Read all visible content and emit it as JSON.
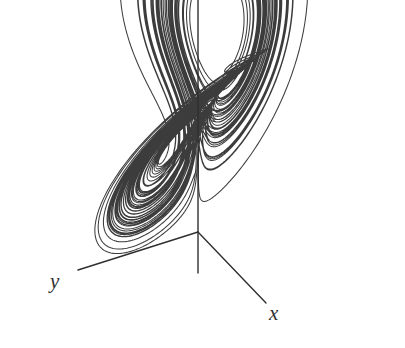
{
  "figure": {
    "kind": "phase-portrait",
    "name": "Lorenz attractor",
    "background_color": "#ffffff",
    "ink_color": "#3c3c3c",
    "axis_color": "#2f2f2f",
    "width": 405,
    "height": 348
  },
  "axes": [
    {
      "id": "x",
      "label": "x",
      "label_position": {
        "x": 269,
        "y": 303
      },
      "line": {
        "x1": 198,
        "y1": 232,
        "x2": 266,
        "y2": 303
      },
      "interactable": false
    },
    {
      "id": "y",
      "label": "y",
      "label_position": {
        "x": 50,
        "y": 271
      },
      "line": {
        "x1": 198,
        "y1": 232,
        "x2": 78,
        "y2": 270
      },
      "interactable": false
    },
    {
      "id": "z",
      "label": "",
      "label_position": null,
      "line": {
        "x1": 198,
        "y1": 0,
        "x2": 198,
        "y2": 273
      },
      "interactable": false
    }
  ],
  "origin": {
    "x": 198,
    "y": 232
  },
  "chart_data": {
    "type": "line",
    "title": "",
    "subtitle": "",
    "xlabel": "x",
    "ylabel": "y",
    "zlabel": "z",
    "legend": [],
    "grid": false,
    "system": "Lorenz equations",
    "equations": [
      "dx/dt = sigma * (y - x)",
      "dy/dt = x * (rho - z) - y",
      "dz/dt = x * y - beta * z"
    ],
    "parameters": {
      "sigma": 10,
      "rho": 28,
      "beta": 2.6666667
    },
    "initial_state": {
      "x": 0.8,
      "y": 0.8,
      "z": 12.0
    },
    "integration": {
      "dt": 0.0042,
      "steps": 17000,
      "method": "rk4"
    },
    "projection": {
      "note": "oblique 3D projection to 2D pixels",
      "origin_px": {
        "x": 198,
        "y": 232
      },
      "x_axis_px": {
        "dx": 4.55,
        "dy": 4.72
      },
      "y_axis_px": {
        "dx": -7.05,
        "dy": 2.24
      },
      "z_axis_px": {
        "dx": 0.0,
        "dy": -5.55
      }
    },
    "lobes": [
      {
        "name": "left-lobe",
        "center_px": {
          "x": 125,
          "y": 96
        },
        "hole": {
          "rx": 13,
          "ry": 14,
          "rotation": 0
        }
      },
      {
        "name": "right-lobe",
        "center_px": {
          "x": 266,
          "y": 115
        },
        "hole": {
          "rx": 30,
          "ry": 18,
          "rotation": -18
        }
      }
    ],
    "stroke_width": 1.05,
    "xlim": [
      -21,
      21
    ],
    "ylim": [
      -28,
      28
    ],
    "zlim": [
      0,
      50
    ]
  }
}
